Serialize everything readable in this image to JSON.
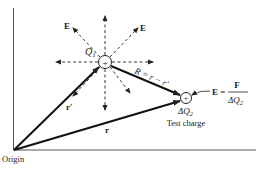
{
  "diagram": {
    "source_charge": {
      "label": "Q",
      "subscript": "1",
      "sign": "+"
    },
    "test_charge": {
      "label": "ΔQ",
      "subscript": "2",
      "sign": "+",
      "caption": "Test charge"
    },
    "field_labels": {
      "upper_left": "E",
      "upper_right": "E"
    },
    "vectors": {
      "r_prime": "r′",
      "r": "r",
      "R": "R = r − r′"
    },
    "equation": {
      "lhs": "E =",
      "numerator": "F",
      "denominator": "ΔQ",
      "denominator_sub": "2"
    },
    "origin_label": "Origin",
    "colors": {
      "ink": "#222222",
      "background": "#ffffff"
    }
  }
}
